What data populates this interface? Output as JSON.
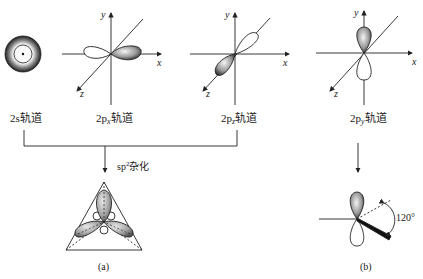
{
  "orbitals": [
    {
      "id": "2s",
      "prefix": "2s",
      "sub": "",
      "suffix": "轨道"
    },
    {
      "id": "2px",
      "prefix": "2p",
      "sub": "x",
      "suffix": "轨道"
    },
    {
      "id": "2pz",
      "prefix": "2p",
      "sub": "z",
      "suffix": "轨道"
    },
    {
      "id": "2py",
      "prefix": "2p",
      "sub": "y",
      "suffix": "轨道"
    }
  ],
  "axes": {
    "x": "x",
    "y": "y",
    "z": "z"
  },
  "hybridization": {
    "prefix": "sp",
    "sup": "2",
    "suffix": "杂化"
  },
  "angle_label": "120°",
  "captions": {
    "a": "(a)",
    "b": "(b)"
  },
  "colors": {
    "line": "#222222",
    "lobe_dark": "#3a3a3a",
    "lobe_light": "#e6e6e6"
  }
}
